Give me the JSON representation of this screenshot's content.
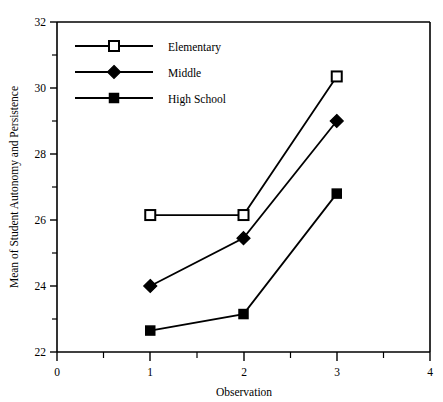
{
  "chart_data": {
    "type": "line",
    "title": "",
    "xlabel": "Observation",
    "ylabel": "Mean of Student Autonomy and Persistence",
    "x": [
      1,
      2,
      3
    ],
    "xlim": [
      0,
      4
    ],
    "ylim": [
      22,
      32
    ],
    "xticks": [
      0,
      1,
      2,
      3,
      4
    ],
    "xtick_labels": [
      "0",
      "1",
      "2",
      "3",
      "4"
    ],
    "xminor_ticks": [
      0.5,
      1.5,
      2.5,
      3.5
    ],
    "yticks": [
      22,
      24,
      26,
      28,
      30,
      32
    ],
    "ytick_labels": [
      "22",
      "24",
      "26",
      "28",
      "30",
      "32"
    ],
    "yminor_ticks": [
      23,
      25,
      27,
      29,
      31
    ],
    "grid": false,
    "legend_position": "upper-left",
    "line_color": "#000000",
    "series": [
      {
        "name": "Elementary",
        "marker": "open-square",
        "values": [
          26.15,
          26.15,
          30.35
        ]
      },
      {
        "name": "Middle",
        "marker": "filled-diamond",
        "values": [
          24.0,
          25.45,
          29.0
        ]
      },
      {
        "name": "High School",
        "marker": "filled-square",
        "values": [
          22.65,
          23.15,
          26.8
        ]
      }
    ]
  },
  "axes": {
    "x_title": "Observation",
    "y_title": "Mean of Student Autonomy and Persistence",
    "x_tick_0": "0",
    "x_tick_1": "1",
    "x_tick_2": "2",
    "x_tick_3": "3",
    "x_tick_4": "4",
    "y_tick_22": "22",
    "y_tick_24": "24",
    "y_tick_26": "26",
    "y_tick_28": "28",
    "y_tick_30": "30",
    "y_tick_32": "32"
  },
  "legend": {
    "entries": [
      {
        "label": "Elementary",
        "marker": "open-square"
      },
      {
        "label": "Middle",
        "marker": "filled-diamond"
      },
      {
        "label": "High School",
        "marker": "filled-square"
      }
    ]
  }
}
